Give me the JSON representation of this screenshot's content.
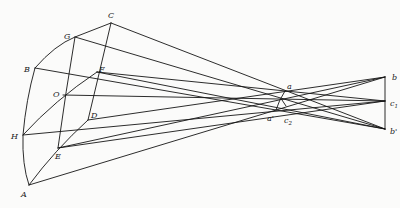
{
  "diagram": {
    "type": "optical-ray-projection",
    "points": {
      "C": {
        "label": "C",
        "x": 111,
        "y": 23
      },
      "G": {
        "label": "G",
        "x": 75,
        "y": 37
      },
      "B": {
        "label": "B",
        "x": 35,
        "y": 68
      },
      "F": {
        "label": "F",
        "x": 97,
        "y": 72
      },
      "O": {
        "label": "O",
        "x": 63,
        "y": 95
      },
      "D": {
        "label": "D",
        "x": 88,
        "y": 120
      },
      "H": {
        "label": "H",
        "x": 23,
        "y": 135
      },
      "E": {
        "label": "E",
        "x": 58,
        "y": 148
      },
      "A": {
        "label": "A",
        "x": 29,
        "y": 185
      },
      "a": {
        "label": "a",
        "x": 285,
        "y": 91
      },
      "a_prime": {
        "label": "a'",
        "x": 276,
        "y": 110
      },
      "c2": {
        "label": "c",
        "sub": "2",
        "x": 283,
        "y": 104
      },
      "b": {
        "label": "b",
        "x": 385,
        "y": 77
      },
      "c1": {
        "label": "c",
        "sub": "1",
        "x": 385,
        "y": 101
      },
      "b_prime": {
        "label": "b'",
        "x": 385,
        "y": 129
      }
    },
    "labels": [
      "C",
      "G",
      "B",
      "F",
      "O",
      "D",
      "H",
      "E",
      "A",
      "a",
      "a'",
      "c2",
      "b",
      "c1",
      "b'"
    ]
  }
}
